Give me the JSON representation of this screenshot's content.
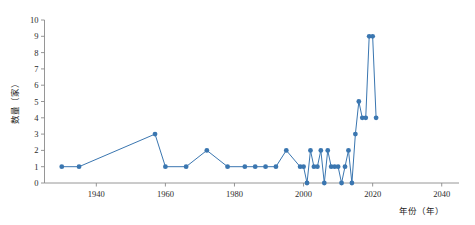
{
  "chart_data": {
    "type": "line",
    "title": "",
    "xlabel": "年份（年）",
    "ylabel": "数量（家）",
    "xlim": [
      1925,
      2045
    ],
    "ylim": [
      0,
      10
    ],
    "xticks": [
      1940,
      1960,
      1980,
      2000,
      2020,
      2040
    ],
    "xtick_labels": [
      "1940",
      "1960",
      "1980",
      "2000",
      "2020",
      "2040"
    ],
    "yticks": [
      0,
      1,
      2,
      3,
      4,
      5,
      6,
      7,
      8,
      9,
      10
    ],
    "ytick_labels": [
      "0",
      "1",
      "2",
      "3",
      "4",
      "5",
      "6",
      "7",
      "8",
      "9",
      "10"
    ],
    "grid": false,
    "legend": false,
    "series": [
      {
        "name": "数量",
        "color": "#3a76b0",
        "marker": "circle",
        "x": [
          1930,
          1935,
          1957,
          1960,
          1966,
          1972,
          1978,
          1983,
          1986,
          1989,
          1992,
          1995,
          1999,
          2000,
          2001,
          2002,
          2003,
          2004,
          2005,
          2006,
          2007,
          2008,
          2009,
          2010,
          2011,
          2012,
          2013,
          2014,
          2015,
          2016,
          2017,
          2018,
          2019,
          2020,
          2021
        ],
        "y": [
          1,
          1,
          3,
          1,
          1,
          2,
          1,
          1,
          1,
          1,
          1,
          2,
          1,
          1,
          0,
          2,
          1,
          1,
          2,
          0,
          2,
          1,
          1,
          1,
          0,
          1,
          2,
          0,
          3,
          5,
          4,
          4,
          9,
          9,
          4
        ]
      }
    ]
  },
  "axes": {
    "ylabel_chars": [
      "数",
      "量",
      "（",
      "家",
      "）"
    ],
    "xlabel_text": "年份（年）"
  }
}
